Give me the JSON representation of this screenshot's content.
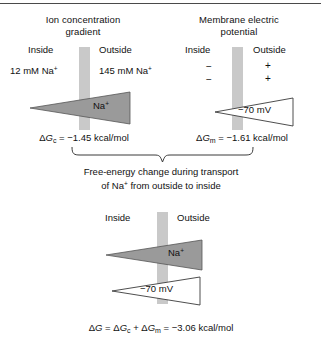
{
  "figure": {
    "background_color": "#ffffff",
    "membrane_color": "#c9c9c9",
    "filled_triangle_color": "#9a9a9a",
    "open_triangle_color": "#ffffff",
    "outline_color": "#3a3a3a"
  },
  "panel_concentration": {
    "title_line1": "Ion concentration",
    "title_line2": "gradient",
    "inside_label": "Inside",
    "outside_label": "Outside",
    "inside_value": "12 mM Na",
    "inside_value_sup": "+",
    "outside_value": "145 mM Na",
    "outside_value_sup": "+",
    "arrow_label": "Na",
    "arrow_label_sup": "+",
    "formula_delta": "Δ",
    "formula_g": "G",
    "formula_sub": "c",
    "formula_rest": " = −1.45 kcal/mol",
    "formula_full": "ΔGc = −1.45 kcal/mol",
    "value": -1.45,
    "units": "kcal/mol"
  },
  "panel_potential": {
    "title_line1": "Membrane electric",
    "title_line2": "potential",
    "inside_label": "Inside",
    "outside_label": "Outside",
    "inside_charges": [
      "−",
      "−"
    ],
    "outside_charges": [
      "+",
      "+"
    ],
    "arrow_label": "−70 mV",
    "formula_delta": "Δ",
    "formula_g": "G",
    "formula_sub": "m",
    "formula_rest": " = −1.61 kcal/mol",
    "formula_full": "ΔGm = −1.61 kcal/mol",
    "value": -1.61,
    "units": "kcal/mol"
  },
  "brace_caption": {
    "line1": "Free-energy change during transport",
    "line2_pre": "of Na",
    "line2_sup": "+",
    "line2_post": " from outside to inside"
  },
  "panel_combined": {
    "inside_label": "Inside",
    "outside_label": "Outside",
    "arrow_label_na": "Na",
    "arrow_label_na_sup": "+",
    "arrow_label_mv": "−70 mV",
    "formula_full": "ΔG = ΔGc + ΔGm = −3.06 kcal/mol",
    "formula_delta": "Δ",
    "formula_g": "G",
    "formula_eq": " = ",
    "formula_sub_c": "c",
    "formula_plus": " + ",
    "formula_sub_m": "m",
    "formula_rest": " = −3.06 kcal/mol",
    "value": -3.06,
    "units": "kcal/mol"
  }
}
